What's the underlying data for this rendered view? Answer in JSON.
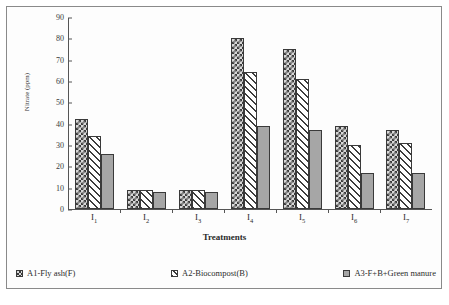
{
  "chart_data": {
    "type": "bar",
    "title": "",
    "xlabel": "Treatments",
    "ylabel": "Nitrate (ppm)",
    "categories": [
      "I₁",
      "I₂",
      "I₃",
      "I₄",
      "I₅",
      "I₆",
      "I₇"
    ],
    "series": [
      {
        "name": "A1-Fly ash(F)",
        "values": [
          42,
          9,
          9,
          80,
          75,
          39,
          37
        ]
      },
      {
        "name": "A2-Biocompost(B)",
        "values": [
          34,
          9,
          9,
          64,
          61,
          30,
          31
        ]
      },
      {
        "name": "A3-F+B+Green manure",
        "values": [
          26,
          8,
          8,
          39,
          37,
          17,
          17
        ]
      }
    ],
    "ylim": [
      0,
      90
    ],
    "ytick_values": [
      90,
      80,
      70,
      60,
      50,
      40,
      30,
      20,
      10,
      0
    ],
    "ytick_labels": [
      "90",
      "80",
      "70",
      "60",
      "50",
      "40",
      "30",
      "20",
      "10",
      "0"
    ],
    "grid": false,
    "legend_position": "bottom"
  },
  "axes": {
    "y_title": "Nitrate (ppm)",
    "x_title": "Treatments"
  },
  "legend": {
    "items": [
      {
        "label": "A1-Fly ash(F)",
        "swatch": "checker-swatch"
      },
      {
        "label": "A2-Biocompost(B)",
        "swatch": "hatch-swatch"
      },
      {
        "label": "A3-F+B+Green manure",
        "swatch": "solid-grey-swatch"
      }
    ]
  },
  "colors": {
    "series1_fill": "#d8d8d8",
    "series1_pattern": "#3d3d3d",
    "series2_fill": "#ffffff",
    "series2_pattern": "#3d3d3d",
    "series3_fill": "#a6a6a6",
    "axis": "#555555",
    "text": "#2b2b2b",
    "frame": "#8a8a8a"
  }
}
